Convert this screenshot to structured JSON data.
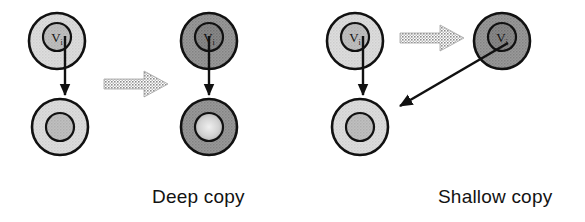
{
  "figure": {
    "background_color": "#ffffff",
    "stroke_color": "#111111",
    "width": 585,
    "height": 222
  },
  "palette": {
    "light_fill": "#d6d6d6",
    "light_inner_fill": "#b5b5b5",
    "dark_fill": "#8e8e8e",
    "dark_inner_fill": "#7a7a7a",
    "highlight_inner_fill": "#cfcfcf",
    "grey_arrow": "#9a9a9a",
    "outline": "#111111",
    "text": "#131313"
  },
  "captions": {
    "deep": "Deep copy",
    "shallow": "Shallow copy"
  },
  "node_label": "V",
  "node_label_sub": "i",
  "panels": [
    {
      "id": "deep-copy",
      "caption": "Deep copy",
      "caption_x": 152,
      "caption_y": 186,
      "objects": [
        {
          "name": "source-container-object",
          "role": "original-outer-object",
          "cx": 57,
          "cy": 41,
          "r": 28,
          "shade": "light",
          "inner": {
            "name": "source-reference-field",
            "cx": 57,
            "cy": 37,
            "r": 14,
            "shade": "light-inner",
            "label": "V",
            "sub": "i"
          }
        },
        {
          "name": "source-referenced-object",
          "role": "original-target-object",
          "cx": 60,
          "cy": 127,
          "r": 28,
          "shade": "light",
          "inner": {
            "name": "source-referenced-core",
            "cx": 60,
            "cy": 127,
            "r": 14,
            "shade": "light-inner",
            "label": "",
            "sub": ""
          }
        },
        {
          "name": "copied-container-object",
          "role": "copy-outer-object",
          "cx": 209,
          "cy": 41,
          "r": 28,
          "shade": "dark",
          "inner": {
            "name": "copied-reference-field",
            "cx": 209,
            "cy": 37,
            "r": 14,
            "shade": "dark-inner",
            "label": "V",
            "sub": "i"
          }
        },
        {
          "name": "copied-referenced-object",
          "role": "copy-target-object",
          "cx": 209,
          "cy": 127,
          "r": 28,
          "shade": "dark",
          "inner": {
            "name": "copied-referenced-core",
            "cx": 209,
            "cy": 127,
            "r": 14,
            "shade": "highlight-inner",
            "label": "",
            "sub": ""
          }
        }
      ],
      "pointer_arrows": [
        {
          "name": "source-reference-arrow",
          "x1": 65,
          "y1": 36,
          "x2": 65,
          "y2": 97
        },
        {
          "name": "copy-reference-arrow",
          "x1": 209,
          "y1": 36,
          "x2": 209,
          "y2": 97
        }
      ],
      "copy_arrows": [
        {
          "name": "deep-copy-operation-arrow",
          "x1": 104,
          "y1": 84,
          "x2": 168,
          "y2": 84
        }
      ]
    },
    {
      "id": "shallow-copy",
      "caption": "Shallow copy",
      "caption_x": 438,
      "caption_y": 186,
      "objects": [
        {
          "name": "source-container-object",
          "role": "original-outer-object",
          "cx": 355,
          "cy": 41,
          "r": 28,
          "shade": "light",
          "inner": {
            "name": "source-reference-field",
            "cx": 355,
            "cy": 37,
            "r": 14,
            "shade": "light-inner",
            "label": "V",
            "sub": "i"
          }
        },
        {
          "name": "source-referenced-object",
          "role": "original-target-object",
          "cx": 360,
          "cy": 127,
          "r": 28,
          "shade": "light",
          "inner": {
            "name": "source-referenced-core",
            "cx": 360,
            "cy": 127,
            "r": 14,
            "shade": "light-inner",
            "label": "",
            "sub": ""
          }
        },
        {
          "name": "copied-container-object",
          "role": "copy-outer-object",
          "cx": 502,
          "cy": 41,
          "r": 28,
          "shade": "dark",
          "inner": {
            "name": "copied-reference-field",
            "cx": 502,
            "cy": 37,
            "r": 14,
            "shade": "dark-inner",
            "label": "V",
            "sub": "i"
          }
        }
      ],
      "pointer_arrows": [
        {
          "name": "source-reference-arrow",
          "x1": 363,
          "y1": 36,
          "x2": 363,
          "y2": 97
        },
        {
          "name": "shared-reference-arrow",
          "x1": 506,
          "y1": 44,
          "x2": 398,
          "y2": 106
        }
      ],
      "copy_arrows": [
        {
          "name": "shallow-copy-operation-arrow",
          "x1": 400,
          "y1": 38,
          "x2": 464,
          "y2": 38
        }
      ]
    }
  ]
}
